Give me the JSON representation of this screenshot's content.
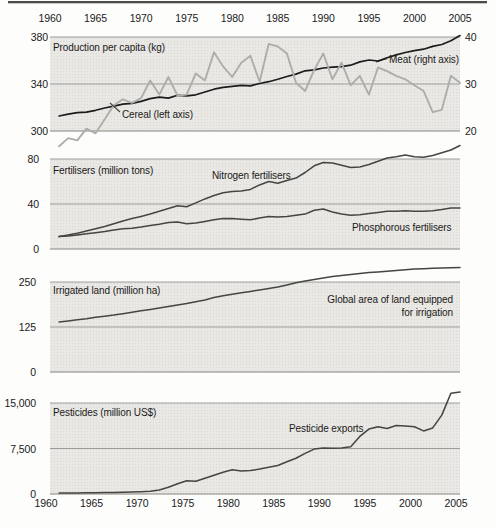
{
  "colors": {
    "panel_bg": "#e9e8e4",
    "grid": "#9c9c9a",
    "axis": "#85847f",
    "text": "#1a1a1a",
    "rule_dark": "#4b4b49",
    "rule_light": "#c9c8c4",
    "meat": "#1c1c1c",
    "cereal": "#adada9",
    "dark_series": "#454542"
  },
  "x_axis": {
    "range": [
      1960,
      2005
    ],
    "tick_years": [
      1960,
      1965,
      1970,
      1975,
      1980,
      1985,
      1990,
      1995,
      2000,
      2005
    ],
    "tick_labels": [
      "1960",
      "1965",
      "1970",
      "1975",
      "1980",
      "1985",
      "1990",
      "1995",
      "2000",
      "2005"
    ],
    "shown": "top and bottom"
  },
  "chart_data": [
    {
      "type": "line",
      "title": "Production per capita (kg)",
      "left_axis": {
        "range": [
          300,
          380
        ],
        "ticks": [
          380,
          340,
          300
        ],
        "tick_labels": [
          "380",
          "340",
          "300"
        ]
      },
      "right_axis": {
        "range": [
          20,
          40
        ],
        "ticks": [
          40,
          30,
          20
        ],
        "tick_labels": [
          "40",
          "30",
          "20"
        ]
      },
      "annotations": [
        {
          "text": "Cereal (left axis)"
        },
        {
          "text": "Meat (right axis)"
        }
      ],
      "series": [
        {
          "name": "Meat (right axis)",
          "axis": "right",
          "color_key": "meat",
          "start_year": 1961,
          "values": [
            23.2,
            23.6,
            23.9,
            24.0,
            24.4,
            24.9,
            25.3,
            25.7,
            25.9,
            26.3,
            26.9,
            27.2,
            27.0,
            27.6,
            27.5,
            27.7,
            28.3,
            28.9,
            29.3,
            29.5,
            29.7,
            29.6,
            30.1,
            30.5,
            31.0,
            31.6,
            32.1,
            32.8,
            33.0,
            33.4,
            33.6,
            33.7,
            34.0,
            34.7,
            35.1,
            34.9,
            35.6,
            36.2,
            36.7,
            37.1,
            37.4,
            38.0,
            38.4,
            39.2,
            40.3
          ]
        },
        {
          "name": "Cereal (left axis)",
          "axis": "left",
          "color_key": "cereal",
          "start_year": 1961,
          "values": [
            287,
            294,
            292,
            302,
            298,
            310,
            322,
            327,
            324,
            328,
            343,
            331,
            346,
            330,
            331,
            349,
            343,
            367,
            355,
            346,
            358,
            364,
            342,
            374,
            372,
            366,
            341,
            334,
            352,
            366,
            344,
            358,
            339,
            347,
            331,
            354,
            351,
            347,
            344,
            339,
            334,
            316,
            318,
            347,
            341
          ]
        }
      ]
    },
    {
      "type": "line",
      "title": "Fertilisers (million tons)",
      "left_axis": {
        "range": [
          0,
          80
        ],
        "ticks": [
          80,
          40,
          0
        ],
        "tick_labels": [
          "80",
          "40",
          "0"
        ]
      },
      "right_axis": null,
      "annotations": [
        {
          "text": "Nitrogen fertilisers"
        },
        {
          "text": "Phosphorous fertilisers"
        }
      ],
      "series": [
        {
          "name": "Nitrogen fertilisers",
          "axis": "left",
          "color_key": "dark_series",
          "start_year": 1961,
          "values": [
            11,
            12.5,
            14,
            16,
            18,
            20,
            22.5,
            25,
            27,
            29,
            31,
            33.5,
            36,
            38.5,
            37.5,
            41,
            44.5,
            47.5,
            50,
            51,
            51.5,
            53,
            57,
            60,
            58.5,
            61,
            63,
            68,
            74,
            77,
            76.5,
            74.5,
            72.5,
            73,
            75,
            78,
            81,
            82,
            83.5,
            82,
            81.5,
            83,
            85.5,
            88,
            92
          ]
        },
        {
          "name": "Phosphorous fertilisers",
          "axis": "left",
          "color_key": "dark_series",
          "start_year": 1961,
          "values": [
            11,
            11.5,
            12.5,
            13.5,
            14.5,
            15.5,
            17,
            18,
            18.5,
            19.5,
            21,
            22,
            23.5,
            24,
            22.5,
            23,
            24.5,
            26,
            27,
            27,
            26.5,
            26,
            27.5,
            29,
            28.5,
            29,
            30,
            31,
            34.5,
            35.5,
            33,
            31,
            30,
            30.5,
            31.5,
            32.5,
            33.5,
            33.5,
            34,
            33.5,
            33.5,
            34,
            35,
            36.5,
            36.5
          ]
        }
      ]
    },
    {
      "type": "line",
      "title": "Irrigated land (million ha)",
      "left_axis": {
        "range": [
          0,
          250
        ],
        "ticks": [
          250,
          125,
          0
        ],
        "tick_labels": [
          "250",
          "125",
          "0"
        ]
      },
      "right_axis": null,
      "annotations": [
        {
          "text": "Global area of land equipped\nfor irrigation"
        }
      ],
      "series": [
        {
          "name": "Global area of land equipped for irrigation",
          "axis": "left",
          "color_key": "dark_series",
          "start_year": 1961,
          "values": [
            139,
            142,
            145,
            148,
            152,
            155,
            158,
            162,
            166,
            170,
            174,
            178,
            182,
            186,
            190,
            195,
            200,
            207,
            212,
            216,
            220,
            224,
            228,
            232,
            236,
            242,
            248,
            253,
            257,
            261,
            265,
            268,
            271,
            274,
            276,
            278,
            280,
            282,
            284,
            286,
            287,
            288,
            289,
            289.5,
            290
          ]
        }
      ]
    },
    {
      "type": "line",
      "title": "Pesticides (million US$)",
      "left_axis": {
        "range": [
          0,
          15000
        ],
        "ticks": [
          15000,
          7500,
          0
        ],
        "tick_labels": [
          "15,000",
          "7,500",
          "0"
        ]
      },
      "right_axis": null,
      "annotations": [
        {
          "text": "Pesticide exports"
        }
      ],
      "series": [
        {
          "name": "Pesticide exports",
          "axis": "left",
          "color_key": "dark_series",
          "start_year": 1961,
          "values": [
            150,
            160,
            175,
            190,
            210,
            230,
            260,
            290,
            330,
            380,
            450,
            650,
            1100,
            1700,
            2200,
            2100,
            2600,
            3100,
            3600,
            4000,
            3800,
            3850,
            4100,
            4400,
            4700,
            5300,
            5900,
            6700,
            7400,
            7600,
            7550,
            7600,
            7800,
            9500,
            10700,
            11100,
            10800,
            11300,
            11200,
            11100,
            10400,
            10900,
            13000,
            16600,
            16800
          ]
        }
      ]
    }
  ]
}
